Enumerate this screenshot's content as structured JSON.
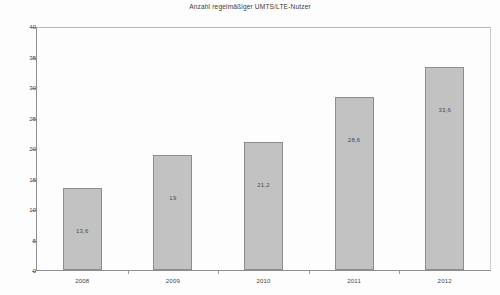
{
  "chart_data": {
    "type": "bar",
    "title": "Anzahl regelmäßiger UMTS/LTE-Nutzer",
    "xlabel": "",
    "ylabel": "",
    "categories": [
      "2008",
      "2009",
      "2010",
      "2011",
      "2012"
    ],
    "values": [
      13.6,
      19,
      21.2,
      28.6,
      33.6
    ],
    "value_labels": [
      "13,6",
      "19",
      "21,2",
      "28,6",
      "33,6"
    ],
    "series": [
      {
        "name": "Anzahl regelmäßiger UMTS/LTE-Nutzer",
        "values": [
          13.6,
          19,
          21.2,
          28.6,
          33.6
        ]
      }
    ],
    "ylim": [
      0,
      40
    ],
    "y_ticks": [
      0,
      5,
      10,
      15,
      20,
      25,
      30,
      35,
      40
    ],
    "y_tick_labels": [
      "0",
      "5",
      "10",
      "15",
      "20",
      "25",
      "30",
      "35",
      "40"
    ],
    "grid": false,
    "legend": false,
    "legend_position": "none",
    "bar_color": "#c2c2c2",
    "bar_border_color": "#8d8d8d",
    "axis_color": "#8f8f8f",
    "text_color": "#3f3f3f"
  }
}
